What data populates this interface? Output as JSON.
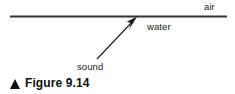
{
  "figure": {
    "caption_marker_icon": "triangle-up-icon",
    "caption_text": "Figure 9.14",
    "background_color": "#ffffff",
    "line_color": "#333333",
    "arrow_color": "#1a1a1a",
    "text_color": "#1a1a1a"
  },
  "diagram": {
    "type": "physics-refraction-diagram",
    "boundary": {
      "name": "air-water-interface",
      "x1": 10,
      "y1": 16,
      "x2": 227,
      "y2": 16,
      "stroke_width": 2,
      "color": "#333333"
    },
    "arrow": {
      "name": "sound-ray",
      "tail_x": 97,
      "tail_y": 59,
      "tip_x": 137,
      "tip_y": 17,
      "stroke_width": 1,
      "head_filled": true,
      "color": "#1a1a1a"
    },
    "labels": {
      "air": "air",
      "water": "water",
      "sound": "sound"
    }
  }
}
